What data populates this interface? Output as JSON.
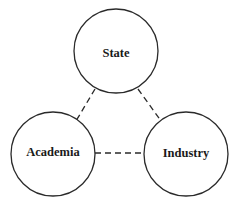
{
  "diagram": {
    "type": "triple-helix",
    "nodes": [
      {
        "id": "state",
        "label": "State",
        "cx": 116,
        "cy": 51,
        "r": 42
      },
      {
        "id": "academia",
        "label": "Academia",
        "cx": 53,
        "cy": 154,
        "r": 42
      },
      {
        "id": "industry",
        "label": "Industry",
        "cx": 186,
        "cy": 154,
        "r": 42
      }
    ],
    "edges": [
      {
        "from": "state",
        "to": "academia",
        "style": "dashed"
      },
      {
        "from": "state",
        "to": "industry",
        "style": "dashed"
      },
      {
        "from": "academia",
        "to": "industry",
        "style": "dashed"
      }
    ],
    "stroke_color": "#2a2a2a"
  }
}
